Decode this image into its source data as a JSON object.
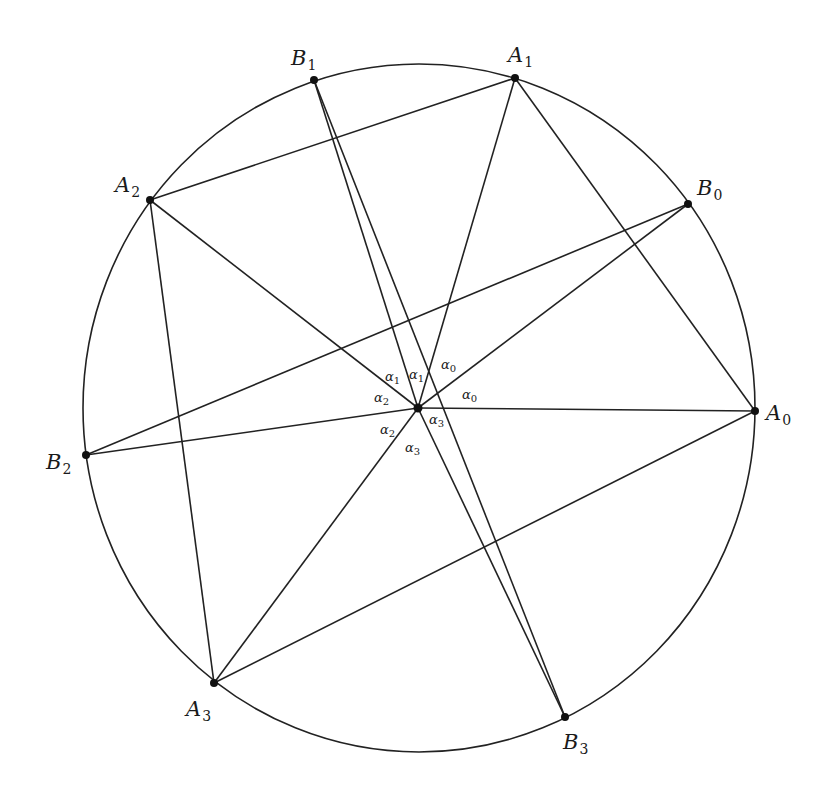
{
  "diagram": {
    "type": "circle-chord-configuration",
    "circle": {
      "cx": 419,
      "cy": 408,
      "rx": 336,
      "ry": 344
    },
    "center": {
      "name": "O",
      "x": 418,
      "y": 408
    },
    "points": [
      {
        "id": "A0",
        "base": "A",
        "sub": "0",
        "x": 755,
        "y": 411,
        "lx": 766,
        "ly": 420
      },
      {
        "id": "A1",
        "base": "A",
        "sub": "1",
        "x": 515,
        "y": 78,
        "lx": 508,
        "ly": 62
      },
      {
        "id": "A2",
        "base": "A",
        "sub": "2",
        "x": 150,
        "y": 200,
        "lx": 115,
        "ly": 192
      },
      {
        "id": "A3",
        "base": "A",
        "sub": "3",
        "x": 214,
        "y": 683,
        "lx": 186,
        "ly": 716
      },
      {
        "id": "B0",
        "base": "B",
        "sub": "0",
        "x": 688,
        "y": 204,
        "lx": 697,
        "ly": 195
      },
      {
        "id": "B1",
        "base": "B",
        "sub": "1",
        "x": 314,
        "y": 80,
        "lx": 291,
        "ly": 65
      },
      {
        "id": "B2",
        "base": "B",
        "sub": "2",
        "x": 86,
        "y": 455,
        "lx": 46,
        "ly": 469
      },
      {
        "id": "B3",
        "base": "B",
        "sub": "3",
        "x": 565,
        "y": 717,
        "lx": 563,
        "ly": 749
      }
    ],
    "segments": [
      [
        "A1",
        "A2"
      ],
      [
        "A2",
        "A3"
      ],
      [
        "A3",
        "A0"
      ],
      [
        "A0",
        "A1"
      ],
      [
        "A0",
        "O"
      ],
      [
        "A1",
        "O"
      ],
      [
        "A2",
        "O"
      ],
      [
        "A3",
        "O"
      ],
      [
        "B0",
        "B2"
      ],
      [
        "B1",
        "B3"
      ],
      [
        "B0",
        "O"
      ],
      [
        "B1",
        "O"
      ],
      [
        "B2",
        "O"
      ],
      [
        "B3",
        "O"
      ]
    ],
    "angle_labels": [
      {
        "base": "α",
        "sub": "0",
        "x": 441,
        "y": 369
      },
      {
        "base": "α",
        "sub": "0",
        "x": 462,
        "y": 399
      },
      {
        "base": "α",
        "sub": "1",
        "x": 385,
        "y": 381
      },
      {
        "base": "α",
        "sub": "1",
        "x": 409,
        "y": 379
      },
      {
        "base": "α",
        "sub": "2",
        "x": 374,
        "y": 402
      },
      {
        "base": "α",
        "sub": "2",
        "x": 380,
        "y": 434
      },
      {
        "base": "α",
        "sub": "3",
        "x": 429,
        "y": 424
      },
      {
        "base": "α",
        "sub": "3",
        "x": 405,
        "y": 452
      }
    ],
    "colors": {
      "stroke": "#222222",
      "point": "#111111",
      "background": "#ffffff"
    }
  }
}
